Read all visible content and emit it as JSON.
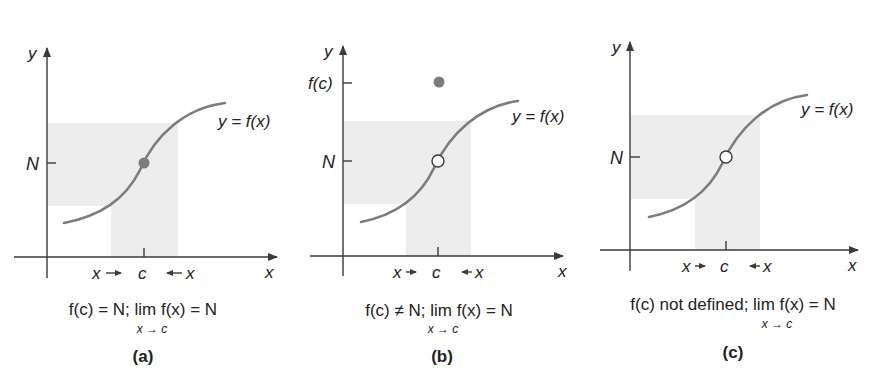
{
  "figure": {
    "panels": [
      {
        "id": "a",
        "label": "(a)",
        "y_axis_label": "y",
        "x_axis_label": "x",
        "n_label": "N",
        "c_label": "c",
        "curve_label": "y = f(x)",
        "approach_left": "x →",
        "approach_right": "← x",
        "point_at_c": "filled",
        "caption_main": "f(c) = N; lim f(x) = N",
        "caption_sub": "x → c"
      },
      {
        "id": "b",
        "label": "(b)",
        "y_axis_label": "y",
        "x_axis_label": "x",
        "n_label": "N",
        "fc_label": "f(c)",
        "c_label": "c",
        "curve_label": "y = f(x)",
        "approach_left": "x →",
        "approach_right": "← x",
        "point_at_c": "open",
        "isolated_point": "f(c) above curve",
        "caption_main": "f(c) ≠ N; lim f(x) = N",
        "caption_sub": "x → c"
      },
      {
        "id": "c",
        "label": "(c)",
        "y_axis_label": "y",
        "x_axis_label": "x",
        "n_label": "N",
        "c_label": "c",
        "curve_label": "y = f(x)",
        "approach_left": "x →",
        "approach_right": "← x",
        "point_at_c": "open",
        "caption_main": "f(c) not defined; lim f(x) = N",
        "caption_sub": "x → c"
      }
    ],
    "colors": {
      "axis": "#3a3a3a",
      "curve": "#7c7c7c",
      "shade": "#ededed"
    }
  }
}
